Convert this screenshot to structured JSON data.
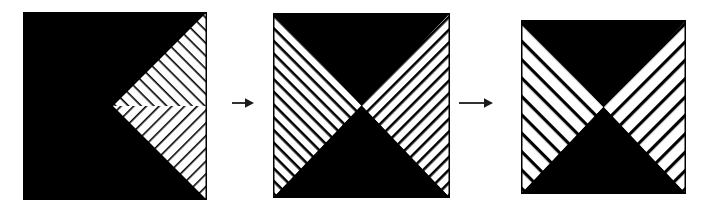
{
  "figure": {
    "title": "Sequence of three hatched square diagrams linked by arrows",
    "background_color": "#ffffff",
    "ink_color": "#000000",
    "paper_color": "#ffffff",
    "width": 709,
    "height": 217
  },
  "panels": [
    {
      "id": "panel-1",
      "label": "Square 1",
      "x": 23,
      "y": 12,
      "width": 184,
      "height": 188,
      "description": "Black square with a white right-pointing triangle whose apex is at the left-centre and whose base is the right edge; the triangle is hatched with fine black diagonal lines, the upper half sloping down-right and the lower half sloping up-right.",
      "fill": "#000000",
      "hatch_color": "#000000",
      "hatch_background": "#ffffff",
      "regions": [
        {
          "name": "upper-right-hatched-triangle",
          "shape": "triangle",
          "hatch": "backslash",
          "line_spacing": 9,
          "line_width": 1.6
        },
        {
          "name": "lower-right-hatched-triangle",
          "shape": "triangle",
          "hatch": "slash",
          "line_spacing": 9,
          "line_width": 1.6
        },
        {
          "name": "black-field",
          "shape": "remainder",
          "hatch": "none"
        }
      ]
    },
    {
      "id": "panel-2",
      "label": "Square 2",
      "x": 273,
      "y": 13,
      "width": 177,
      "height": 185,
      "description": "Square divided into four triangles by its diagonals: top and bottom triangles solid black, left and right triangles white with fine diagonal hatching; left triangle lines slope down-right, right triangle lines slope up-right.",
      "fill": "#000000",
      "hatch_color": "#000000",
      "hatch_background": "#ffffff",
      "regions": [
        {
          "name": "top-black-triangle",
          "shape": "triangle",
          "hatch": "none"
        },
        {
          "name": "bottom-black-triangle",
          "shape": "triangle",
          "hatch": "none"
        },
        {
          "name": "left-hatched-triangle",
          "shape": "triangle",
          "hatch": "backslash",
          "line_spacing": 9,
          "line_width": 2.6
        },
        {
          "name": "right-hatched-triangle",
          "shape": "triangle",
          "hatch": "slash",
          "line_spacing": 9,
          "line_width": 2.6
        }
      ]
    },
    {
      "id": "panel-3",
      "label": "Square 3",
      "x": 521,
      "y": 20,
      "width": 165,
      "height": 174,
      "description": "Same four-triangle division as square 2 but with coarser hatching: wider white bands separated by thin black lines; left triangle lines slope down-right, right triangle lines slope up-right.",
      "fill": "#000000",
      "hatch_color": "#000000",
      "hatch_background": "#ffffff",
      "regions": [
        {
          "name": "top-black-triangle",
          "shape": "triangle",
          "hatch": "none"
        },
        {
          "name": "bottom-black-triangle",
          "shape": "triangle",
          "hatch": "none"
        },
        {
          "name": "left-hatched-triangle",
          "shape": "triangle",
          "hatch": "backslash",
          "line_spacing": 13,
          "line_width": 3.2
        },
        {
          "name": "right-hatched-triangle",
          "shape": "triangle",
          "hatch": "slash",
          "line_spacing": 13,
          "line_width": 3.2
        }
      ]
    }
  ],
  "arrows": [
    {
      "id": "arrow-1",
      "glyph": "→",
      "direction": "right",
      "x": 231,
      "y": 94,
      "width": 24,
      "height": 18,
      "shaft_length": 13,
      "color": "#1a1a1a"
    },
    {
      "id": "arrow-2",
      "glyph": "→",
      "direction": "right",
      "x": 458,
      "y": 94,
      "width": 36,
      "height": 18,
      "shaft_length": 25,
      "color": "#1a1a1a"
    }
  ]
}
